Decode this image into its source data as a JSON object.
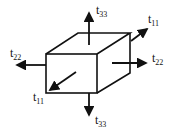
{
  "diagram": {
    "type": "stress-cube",
    "stroke_color": "#111111",
    "labels": {
      "top": {
        "base": "t",
        "sub": "33"
      },
      "top_right": {
        "base": "t",
        "sub": "11"
      },
      "left": {
        "base": "t",
        "sub": "22"
      },
      "right": {
        "base": "t",
        "sub": "22"
      },
      "front": {
        "base": "t",
        "sub": "11"
      },
      "bottom": {
        "base": "t",
        "sub": "33"
      }
    }
  }
}
